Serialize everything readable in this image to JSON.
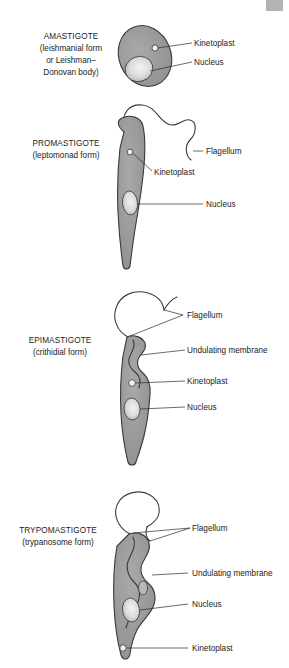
{
  "figure": {
    "background_color": "#ffffff",
    "body_fill_color": "#9a9a9a",
    "outline_color": "#3a3a3a",
    "organelle_fill_color": "#d5d5d5",
    "label_color": "#222222"
  },
  "stages": [
    {
      "id": "amastigote",
      "name": "AMASTIGOTE",
      "subtitle_lines": [
        "(leishmanial form",
        "or Leishman–",
        "Donovan body)"
      ],
      "parts": [
        {
          "id": "kinetoplast",
          "label": "Kinetoplast"
        },
        {
          "id": "nucleus",
          "label": "Nucleus"
        }
      ]
    },
    {
      "id": "promastigote",
      "name": "PROMASTIGOTE",
      "subtitle_lines": [
        "(leptomonad form)"
      ],
      "parts": [
        {
          "id": "flagellum",
          "label": "Flagellum"
        },
        {
          "id": "kinetoplast",
          "label": "Kinetoplast"
        },
        {
          "id": "nucleus",
          "label": "Nucleus"
        }
      ]
    },
    {
      "id": "epimastigote",
      "name": "EPIMASTIGOTE",
      "subtitle_lines": [
        "(crithidial form)"
      ],
      "parts": [
        {
          "id": "flagellum",
          "label": "Flagellum"
        },
        {
          "id": "undulating-membrane",
          "label": "Undulating membrane"
        },
        {
          "id": "kinetoplast",
          "label": "Kinetoplast"
        },
        {
          "id": "nucleus",
          "label": "Nucleus"
        }
      ]
    },
    {
      "id": "trypomastigote",
      "name": "TRYPOMASTIGOTE",
      "subtitle_lines": [
        "(trypanosome form)"
      ],
      "parts": [
        {
          "id": "flagellum",
          "label": "Flagellum"
        },
        {
          "id": "undulating-membrane",
          "label": "Undulating membrane"
        },
        {
          "id": "nucleus",
          "label": "Nucleus"
        },
        {
          "id": "kinetoplast",
          "label": "Kinetoplast"
        }
      ]
    }
  ]
}
